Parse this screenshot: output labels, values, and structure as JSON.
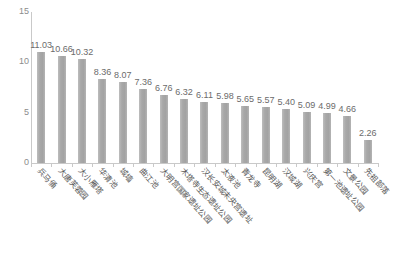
{
  "chart_data": {
    "type": "bar",
    "title": "",
    "subtitle": "",
    "xlabel": "",
    "ylabel": "",
    "ylim": [
      0,
      15
    ],
    "y_ticks": [
      "0",
      "5",
      "10",
      "15"
    ],
    "y_tick_values": [
      0,
      5,
      10,
      15
    ],
    "grid": false,
    "legend": "none",
    "categories": [
      "兵马俑",
      "大唐芙蓉园",
      "大小雁塔",
      "华清池",
      "城墙",
      "曲江池",
      "大明宫国家遗址公园",
      "木塔寺生态遗址公园",
      "汉长安城未央宫遗址",
      "太液池",
      "青龙寺",
      "昆明湖",
      "汉城湖",
      "兴庆宫",
      "第一池遗址公园",
      "文景公园",
      "先祖部落"
    ],
    "values": [
      11.03,
      10.66,
      10.32,
      8.36,
      8.07,
      7.36,
      6.76,
      6.32,
      6.11,
      5.98,
      5.65,
      5.57,
      5.4,
      5.09,
      4.99,
      4.66,
      2.26
    ],
    "value_labels": [
      "11.03",
      "10.66",
      "10.32",
      "8.36",
      "8.07",
      "7.36",
      "6.76",
      "6.32",
      "6.11",
      "5.98",
      "5.65",
      "5.57",
      "5.40",
      "5.09",
      "4.99",
      "4.66",
      "2.26"
    ],
    "bar_color": "#a8a8a8",
    "axis_color": "#c9c9c9",
    "label_color": "#6b6b6b"
  }
}
